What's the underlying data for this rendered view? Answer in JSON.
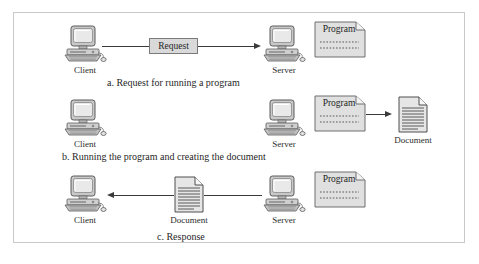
{
  "figure": {
    "border_color": "#c9c9c9",
    "background": "#ffffff"
  },
  "labels": {
    "client": "Client",
    "server": "Server",
    "program": "Program",
    "document": "Document",
    "request": "Request"
  },
  "rows": [
    {
      "id": "a",
      "caption": "a. Request for running a program",
      "client": "Client",
      "server": "Server",
      "program": "Program",
      "message": "Request",
      "arrow_direction": "right"
    },
    {
      "id": "b",
      "caption": "b. Running the program and creating the document",
      "client": "Client",
      "server": "Server",
      "program": "Program",
      "document": "Document",
      "arrow_direction": "right"
    },
    {
      "id": "c",
      "caption": "c. Response",
      "client": "Client",
      "server": "Server",
      "program": "Program",
      "document": "Document",
      "arrow_direction": "left"
    }
  ],
  "colors": {
    "line": "#3a3a3a",
    "box_fill": "#d9d9d9",
    "box_stroke": "#7a7a7a",
    "sheet_fill": "#e0e0e0",
    "sheet_stroke": "#6e6e6e",
    "screen_fill": "#d5d5d5"
  }
}
